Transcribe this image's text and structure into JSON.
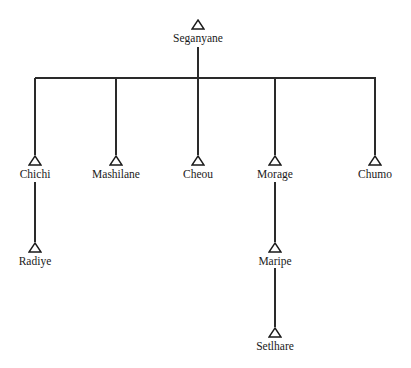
{
  "diagram": {
    "type": "kinship-chart",
    "symbol": "triangle-male",
    "line_color": "#2a2a2a",
    "root": {
      "label": "Seganyane",
      "x": 198,
      "y": 19
    },
    "children": [
      {
        "label": "Chichi",
        "x": 35,
        "y": 155
      },
      {
        "label": "Mashilane",
        "x": 116,
        "y": 155
      },
      {
        "label": "Cheou",
        "x": 198,
        "y": 155
      },
      {
        "label": "Morage",
        "x": 275,
        "y": 155
      },
      {
        "label": "Chumo",
        "x": 375,
        "y": 155
      }
    ],
    "grandchildren": [
      {
        "label": "Radiye",
        "parent": "Chichi",
        "x": 35,
        "y": 242
      },
      {
        "label": "Maripe",
        "parent": "Morage",
        "x": 275,
        "y": 242
      }
    ],
    "great_grandchildren": [
      {
        "label": "Setlhare",
        "parent": "Maripe",
        "x": 275,
        "y": 327
      }
    ],
    "sibling_bar": {
      "y": 78,
      "x1": 35,
      "x2": 375
    }
  }
}
